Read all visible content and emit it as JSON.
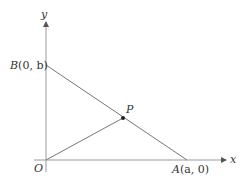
{
  "diagram": {
    "axes": {
      "x_label": "x",
      "y_label": "y",
      "origin_label": "O"
    },
    "points": {
      "A": {
        "label_name": "A",
        "label_coords": "(a, 0)"
      },
      "B": {
        "label_name": "B",
        "label_coords": "(0, b)"
      },
      "P": {
        "label_name": "P"
      }
    },
    "segments": [
      "AB",
      "OP"
    ],
    "colors": {
      "axis": "#999999",
      "line": "#777777",
      "point": "#222222",
      "text": "#333333"
    }
  }
}
